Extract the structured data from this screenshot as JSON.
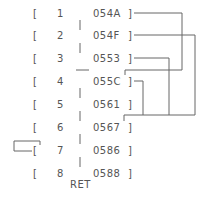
{
  "diagram": {
    "rows": [
      {
        "index": "1",
        "address": "054A"
      },
      {
        "index": "2",
        "address": "054F"
      },
      {
        "index": "3",
        "address": "0553"
      },
      {
        "index": "4",
        "address": "055C"
      },
      {
        "index": "5",
        "address": "0561"
      },
      {
        "index": "6",
        "address": "0567"
      },
      {
        "index": "7",
        "address": "0586"
      },
      {
        "index": "8",
        "address": "0588"
      }
    ],
    "open_bracket": "[",
    "close_bracket": "]",
    "footer_label": "RET",
    "line_color": "#666666"
  }
}
